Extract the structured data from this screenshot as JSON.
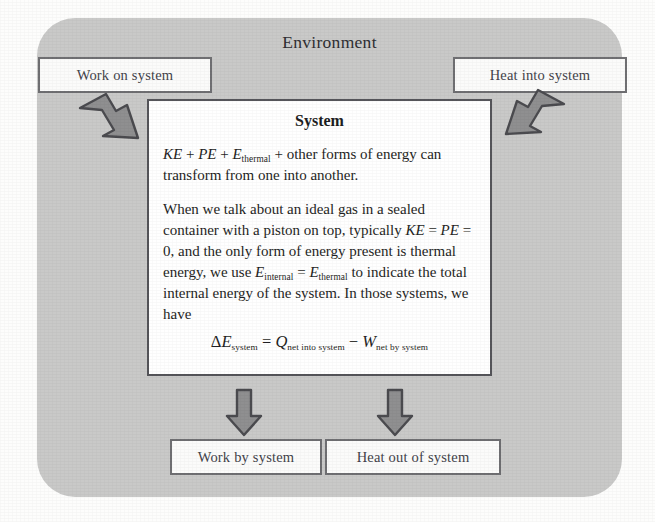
{
  "diagram": {
    "environment_label": "Environment",
    "system_title": "System",
    "colors": {
      "environment_fill": "#c9c9c8",
      "system_fill": "#ffffff",
      "box_border": "#6f6f72",
      "arrow_fill": "#8f8f90",
      "arrow_stroke": "#4b4b4f",
      "text": "#1f1f24",
      "page_background": "#fdfdfc"
    },
    "io_boxes": {
      "work_on_system": "Work on system",
      "heat_into_system": "Heat into system",
      "work_by_system": "Work by system",
      "heat_out_of_system": "Heat out of system"
    },
    "arrows": [
      {
        "name": "work-in-arrow",
        "direction": "down-right",
        "meaning": "Work on system enters the system"
      },
      {
        "name": "heat-in-arrow",
        "direction": "down-left",
        "meaning": "Heat into system enters the system"
      },
      {
        "name": "work-out-arrow",
        "direction": "down",
        "meaning": "Work by system leaves the system"
      },
      {
        "name": "heat-out-arrow",
        "direction": "down",
        "meaning": "Heat out of system leaves the system"
      }
    ],
    "paragraph1": {
      "var_ke": "KE",
      "plus1": " + ",
      "var_pe": "PE",
      "plus2": " + ",
      "var_e": "E",
      "sub_thermal": "thermal",
      "tail": " + other forms of energy can transform from one into another."
    },
    "paragraph2": {
      "lead": "When we talk about an ideal gas in a sealed container with a piston on top, typically ",
      "var_ke": "KE",
      "eq1": " = ",
      "var_pe": "PE",
      "eq2": " = 0",
      "mid": ", and the only form of energy present is thermal energy, we use ",
      "var_e1": "E",
      "sub_internal": "internal",
      "eq3": " = ",
      "var_e2": "E",
      "sub_thermal": "thermal",
      "tail": " to indicate the total internal energy of the system. In those systems, we have"
    },
    "equation": {
      "delta": "Δ",
      "var_e": "E",
      "sub_system": "system",
      "equals": " = ",
      "var_q": "Q",
      "sub_net_into": "net into system",
      "minus": " − ",
      "var_w": "W",
      "sub_net_by": "net by system",
      "plain": "ΔE_system = Q_net into system − W_net by system"
    }
  }
}
